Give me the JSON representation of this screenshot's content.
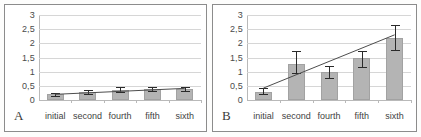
{
  "figure": {
    "background": "#fdfdfc",
    "bar_color": "#b4b4b4",
    "error_color": "#2a2a2a",
    "trend_color": "#4d4d4d",
    "grid_color": "#d6d6d6"
  },
  "panels": [
    {
      "letter": "A",
      "name": "panel-a",
      "yticks": [
        "3",
        "2,5",
        "2",
        "1,5",
        "1",
        "0,5",
        "0"
      ]
    },
    {
      "letter": "B",
      "name": "panel-b",
      "yticks": [
        "3",
        "2,5",
        "2",
        "1,5",
        "1",
        "0,5",
        "0"
      ]
    }
  ],
  "chart_data": [
    {
      "type": "bar",
      "panel": "A",
      "title": "",
      "xlabel": "",
      "ylabel": "",
      "categories": [
        "initial",
        "second",
        "fourth",
        "fifth",
        "sixth"
      ],
      "values": [
        0.2,
        0.28,
        0.37,
        0.38,
        0.4
      ],
      "errors_upper": [
        0.25,
        0.36,
        0.47,
        0.45,
        0.47
      ],
      "errors_lower": [
        0.15,
        0.21,
        0.28,
        0.31,
        0.33
      ],
      "trend": {
        "x_start": "initial",
        "y_start": 0.2,
        "x_end": "sixth",
        "y_end": 0.41
      },
      "ylim": [
        0,
        3
      ],
      "ytick_values": [
        0,
        0.5,
        1,
        1.5,
        2,
        2.5,
        3
      ],
      "grid": true,
      "legend": "none"
    },
    {
      "type": "bar",
      "panel": "B",
      "title": "",
      "xlabel": "",
      "ylabel": "",
      "categories": [
        "initial",
        "second",
        "fourth",
        "fifth",
        "sixth"
      ],
      "values": [
        0.3,
        1.27,
        1.0,
        1.48,
        2.2
      ],
      "errors_upper": [
        0.42,
        1.72,
        1.2,
        1.73,
        2.65
      ],
      "errors_lower": [
        0.2,
        0.95,
        0.78,
        1.15,
        1.75
      ],
      "trend": {
        "x_start": "initial",
        "y_start": 0.42,
        "x_end": "sixth",
        "y_end": 2.3
      },
      "ylim": [
        0,
        3
      ],
      "ytick_values": [
        0,
        0.5,
        1,
        1.5,
        2,
        2.5,
        3
      ],
      "grid": true,
      "legend": "none"
    }
  ]
}
